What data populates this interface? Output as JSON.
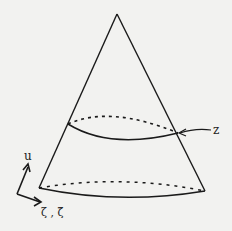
{
  "diagram": {
    "type": "cone",
    "labels": {
      "z": "z",
      "u": "u",
      "zeta": "ζ , ζ̃"
    },
    "colors": {
      "background": "#f2f2f0",
      "stroke": "#1a1a1a"
    }
  }
}
